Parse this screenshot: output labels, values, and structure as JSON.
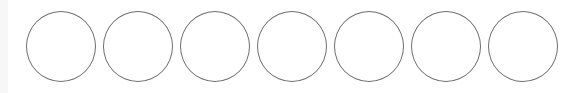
{
  "circles": {
    "count": 7,
    "items": [
      {
        "index": 1,
        "filled": false
      },
      {
        "index": 2,
        "filled": false
      },
      {
        "index": 3,
        "filled": false
      },
      {
        "index": 4,
        "filled": false
      },
      {
        "index": 5,
        "filled": false
      },
      {
        "index": 6,
        "filled": false
      },
      {
        "index": 7,
        "filled": false
      }
    ],
    "stroke_color": "#6e6e6e",
    "fill_color": "#ffffff"
  }
}
